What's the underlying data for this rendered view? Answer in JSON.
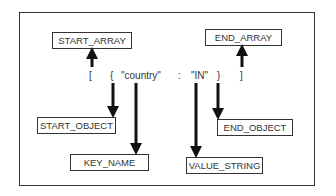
{
  "diagram": {
    "boxes": {
      "start_array": "START_ARRAY",
      "end_array": "END_ARRAY",
      "start_object": "START_OBJECT",
      "end_object": "END_OBJECT",
      "key_name": "KEY_NAME",
      "value_string": "VALUE_STRING"
    },
    "tokens": {
      "open_bracket": "[",
      "open_brace": "{",
      "key": "\"country\"",
      "colon": ":",
      "value": "\"IN\"",
      "close_brace": "}",
      "close_bracket": "]"
    }
  }
}
